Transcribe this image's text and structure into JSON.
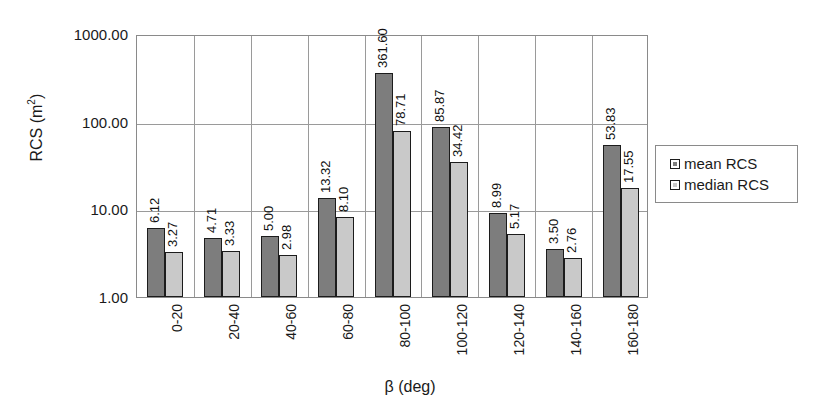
{
  "chart_data": {
    "type": "bar",
    "title": "",
    "xlabel": "β (deg)",
    "ylabel": "RCS (m²)",
    "ylabel_base": "RCS (m",
    "ylabel_sup": "2",
    "ylabel_close": ")",
    "yscale": "log",
    "ylim": [
      1.0,
      1000.0
    ],
    "ytick_labels": [
      "1000.00",
      "100.00",
      "10.00",
      "1.00"
    ],
    "ytick_values": [
      1000.0,
      100.0,
      10.0,
      1.0
    ],
    "grid": "horizontal-and-vertical",
    "legend_position": "right",
    "categories": [
      "0-20",
      "20-40",
      "40-60",
      "60-80",
      "80-100",
      "100-120",
      "120-140",
      "140-160",
      "160-180"
    ],
    "series": [
      {
        "name": "mean RCS",
        "color": "#7d7d7d",
        "values": [
          6.12,
          4.71,
          5.0,
          13.32,
          361.6,
          85.87,
          8.99,
          3.5,
          53.83
        ],
        "labels": [
          "6.12",
          "4.71",
          "5.00",
          "13.32",
          "361.60",
          "85.87",
          "8.99",
          "3.50",
          "53.83"
        ]
      },
      {
        "name": "median RCS",
        "color": "#c9c9c9",
        "values": [
          3.27,
          3.33,
          2.98,
          8.1,
          78.71,
          34.42,
          5.17,
          2.76,
          17.55
        ],
        "labels": [
          "3.27",
          "3.33",
          "2.98",
          "8.10",
          "78.71",
          "34.42",
          "5.17",
          "2.76",
          "17.55"
        ]
      }
    ]
  },
  "legend": {
    "entries": [
      {
        "label": "mean RCS",
        "swatch": "dark-gray-swatch"
      },
      {
        "label": "median RCS",
        "swatch": "light-gray-swatch"
      }
    ]
  }
}
